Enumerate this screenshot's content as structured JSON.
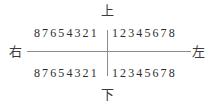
{
  "diagram": {
    "type": "dental-quadrant-chart",
    "labels": {
      "top": "上",
      "bottom": "下",
      "right_side": "右",
      "left_side": "左"
    },
    "quadrants": {
      "upper_right": "87654321",
      "upper_left": "12345678",
      "lower_right": "87654321",
      "lower_left": "12345678"
    },
    "colors": {
      "text": "#3a3a3a",
      "axis_line": "#8c8c8c",
      "background": "#ffffff"
    }
  }
}
